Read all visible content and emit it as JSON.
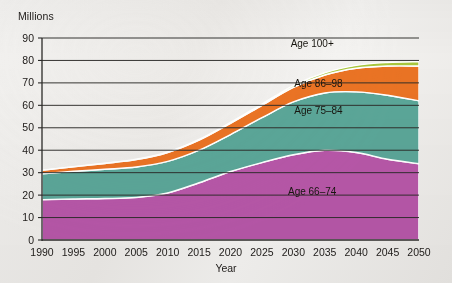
{
  "figure": {
    "y_unit_label": "Millions",
    "x_axis_title": "Year"
  },
  "chart_data": {
    "type": "area",
    "stacked": true,
    "title": "",
    "subtitle": "",
    "xlabel": "Year",
    "ylabel": "Millions",
    "xlim": [
      1990,
      2050
    ],
    "ylim": [
      0,
      90
    ],
    "ytick_step": 10,
    "grid": true,
    "legend": "inline-band-labels",
    "x": [
      1990,
      1995,
      2000,
      2005,
      2010,
      2015,
      2020,
      2025,
      2030,
      2035,
      2040,
      2045,
      2050
    ],
    "xticklabels": [
      "1990",
      "1995",
      "2000",
      "2005",
      "2010",
      "2015",
      "2020",
      "2025",
      "2030",
      "2035",
      "2040",
      "2045",
      "2050"
    ],
    "yticklabels": [
      "0",
      "10",
      "20",
      "30",
      "40",
      "50",
      "60",
      "70",
      "80",
      "90"
    ],
    "series": [
      {
        "name": "Age 66–74",
        "label": "Age 66–74",
        "color": "#b757a8",
        "values": [
          18.0,
          18.3,
          18.5,
          19.0,
          21.0,
          25.5,
          30.5,
          34.5,
          38.0,
          40.0,
          39.0,
          36.0,
          34.0
        ]
      },
      {
        "name": "Age 75–84",
        "label": "Age 75–84",
        "color": "#5ba698",
        "values": [
          11.5,
          12.3,
          13.0,
          13.5,
          14.0,
          14.5,
          16.5,
          20.0,
          23.5,
          25.5,
          27.0,
          28.5,
          28.0
        ]
      },
      {
        "name": "Age 86–98",
        "label": "Age 86–98",
        "color": "#ea7324",
        "values": [
          1.5,
          2.0,
          2.6,
          3.3,
          4.0,
          4.5,
          5.0,
          5.5,
          6.5,
          8.0,
          10.5,
          13.0,
          15.5
        ]
      },
      {
        "name": "Age 100+",
        "label": "Age 100+",
        "color": "#a8c63c",
        "values": [
          0.05,
          0.07,
          0.1,
          0.15,
          0.2,
          0.3,
          0.4,
          0.6,
          0.8,
          1.0,
          1.3,
          1.6,
          2.0
        ]
      }
    ],
    "totals": [
      31.05,
      32.67,
      34.2,
      35.95,
      39.2,
      44.8,
      52.4,
      60.6,
      68.8,
      74.5,
      77.8,
      79.1,
      79.5
    ],
    "band_label_positions": [
      {
        "label": "Age 100+",
        "x": 2033,
        "y": 86
      },
      {
        "label": "Age 86–98",
        "x": 2034,
        "y": 68
      },
      {
        "label": "Age 75–84",
        "x": 2034,
        "y": 56
      },
      {
        "label": "Age 66–74",
        "x": 2033,
        "y": 20
      }
    ]
  }
}
